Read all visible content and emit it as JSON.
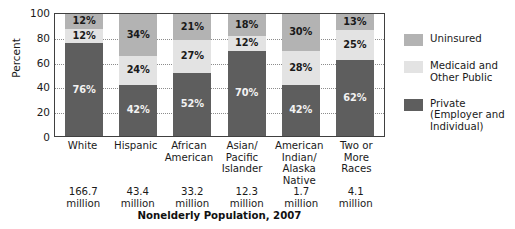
{
  "chart_data": {
    "type": "bar",
    "subtype": "stacked-bar-100",
    "title": "",
    "xlabel": "Nonelderly Population, 2007",
    "ylabel": "Percent",
    "ylim": [
      0,
      100
    ],
    "yticks": [
      0,
      20,
      40,
      60,
      80,
      100
    ],
    "grid": true,
    "legend_position": "right",
    "categories": [
      "White",
      "Hispanic",
      "African American",
      "Asian/ Pacific Islander",
      "American Indian/ Alaska Native",
      "Two or More Races"
    ],
    "series": [
      {
        "name": "Private (Employer and Individual)",
        "color": "#5e5e5e",
        "values": [
          76,
          42,
          52,
          70,
          42,
          62
        ]
      },
      {
        "name": "Medicaid and Other Public",
        "color": "#e3e3e3",
        "values": [
          12,
          24,
          27,
          12,
          28,
          25
        ]
      },
      {
        "name": "Uninsured",
        "color": "#b3b3b3",
        "values": [
          12,
          34,
          21,
          18,
          30,
          13
        ]
      }
    ],
    "data_labels": {
      "private": [
        "76%",
        "42%",
        "52%",
        "70%",
        "42%",
        "62%"
      ],
      "medicaid": [
        "12%",
        "24%",
        "27%",
        "12%",
        "28%",
        "25%"
      ],
      "uninsured": [
        "12%",
        "34%",
        "21%",
        "18%",
        "30%",
        "13%"
      ]
    },
    "annotations": {
      "population": [
        "166.7 million",
        "43.4 million",
        "33.2 million",
        "12.3 million",
        "1.7 million",
        "4.1 million"
      ]
    }
  },
  "axis": {
    "ylabel": "Percent",
    "ticks": [
      "100",
      "80",
      "60",
      "40",
      "20",
      "0"
    ]
  },
  "xaxis": {
    "labels": [
      {
        "line1": "White",
        "line2": "",
        "line3": ""
      },
      {
        "line1": "Hispanic",
        "line2": "",
        "line3": ""
      },
      {
        "line1": "African",
        "line2": "American",
        "line3": ""
      },
      {
        "line1": "Asian/",
        "line2": "Pacific",
        "line3": "Islander"
      },
      {
        "line1": "American",
        "line2": "Indian/",
        "line3": "Alaska Native"
      },
      {
        "line1": "Two or",
        "line2": "More",
        "line3": "Races"
      }
    ]
  },
  "populations": [
    {
      "value": "166.7",
      "unit": "million"
    },
    {
      "value": "43.4",
      "unit": "million"
    },
    {
      "value": "33.2",
      "unit": "million"
    },
    {
      "value": "12.3",
      "unit": "million"
    },
    {
      "value": "1.7",
      "unit": "million"
    },
    {
      "value": "4.1",
      "unit": "million"
    }
  ],
  "caption": "Nonelderly Population, 2007",
  "legend": {
    "items": [
      {
        "label_line1": "Uninsured",
        "label_line2": "",
        "color": "#b3b3b3",
        "key": "uninsured"
      },
      {
        "label_line1": "Medicaid and",
        "label_line2": "Other Public",
        "color": "#e3e3e3",
        "key": "medicaid"
      },
      {
        "label_line1": "Private",
        "label_line2": "(Employer and",
        "label_line3": "Individual)",
        "color": "#5e5e5e",
        "key": "private"
      }
    ]
  },
  "bars": [
    {
      "cat": "White",
      "uninsured": "12%",
      "medicaid": "12%",
      "private": "76%",
      "u": 12,
      "m": 12,
      "p": 76
    },
    {
      "cat": "Hispanic",
      "uninsured": "34%",
      "medicaid": "24%",
      "private": "42%",
      "u": 34,
      "m": 24,
      "p": 42
    },
    {
      "cat": "African American",
      "uninsured": "21%",
      "medicaid": "27%",
      "private": "52%",
      "u": 21,
      "m": 27,
      "p": 52
    },
    {
      "cat": "Asian/Pacific Islander",
      "uninsured": "18%",
      "medicaid": "12%",
      "private": "70%",
      "u": 18,
      "m": 12,
      "p": 70
    },
    {
      "cat": "American Indian/Alaska Native",
      "uninsured": "30%",
      "medicaid": "28%",
      "private": "42%",
      "u": 30,
      "m": 28,
      "p": 42
    },
    {
      "cat": "Two or More Races",
      "uninsured": "13%",
      "medicaid": "25%",
      "private": "62%",
      "u": 13,
      "m": 25,
      "p": 62
    }
  ]
}
